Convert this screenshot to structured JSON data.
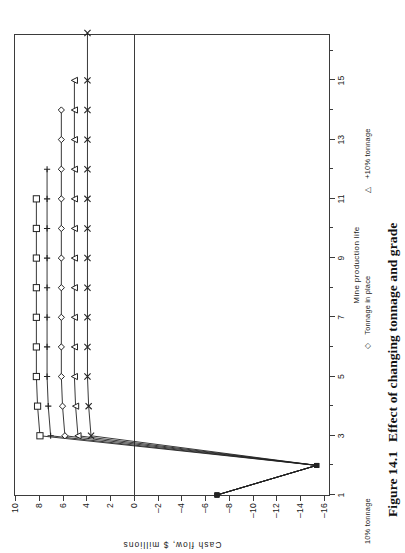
{
  "caption": {
    "number": "Figure 14.1",
    "text": "Effect of changing tonnage and grade"
  },
  "chart_data": {
    "type": "line",
    "title": "",
    "xlabel": "Mine production life",
    "ylabel": "Cash flow, $ millions",
    "xlim": [
      1,
      16.6
    ],
    "ylim": [
      -16.6,
      10
    ],
    "grid": false,
    "legend_position": "below-axis",
    "x_ticks_major": [
      1,
      3,
      5,
      7,
      9,
      11,
      13,
      15
    ],
    "x_ticks_minor": [
      2,
      4,
      6,
      8,
      10,
      12,
      14,
      16
    ],
    "y_ticks_major": [
      10,
      8,
      6,
      4,
      2,
      0,
      -2,
      -4,
      -6,
      -8,
      -10,
      -12,
      -14,
      -16
    ],
    "zero_line": 0,
    "series": [
      {
        "name": "-10% tonnage",
        "marker": "square",
        "x": [
          1,
          2,
          3,
          4,
          5,
          6,
          7,
          8,
          9,
          10,
          11
        ],
        "y": [
          -7.0,
          -15.4,
          7.9,
          8.1,
          8.2,
          8.2,
          8.2,
          8.2,
          8.2,
          8.2,
          8.2
        ]
      },
      {
        "name": "Base case",
        "marker": "plus",
        "x": [
          1,
          2,
          3,
          4,
          5,
          6,
          7,
          8,
          9,
          10,
          11,
          12
        ],
        "y": [
          -7.0,
          -15.4,
          7.0,
          7.2,
          7.3,
          7.3,
          7.3,
          7.3,
          7.3,
          7.3,
          7.3,
          7.3
        ]
      },
      {
        "name": "Tonnage in place",
        "marker": "diamond",
        "x": [
          1,
          2,
          3,
          4,
          5,
          6,
          7,
          8,
          9,
          10,
          11,
          12,
          13,
          14
        ],
        "y": [
          -7.0,
          -15.4,
          5.8,
          6.0,
          6.1,
          6.1,
          6.1,
          6.1,
          6.1,
          6.1,
          6.1,
          6.1,
          6.1,
          6.1
        ]
      },
      {
        "name": "+10% tonnage",
        "marker": "triangle",
        "x": [
          1,
          2,
          3,
          4,
          5,
          6,
          7,
          8,
          9,
          10,
          11,
          12,
          13,
          14,
          15
        ],
        "y": [
          -7.0,
          -15.4,
          4.7,
          4.9,
          5.0,
          5.0,
          5.0,
          5.0,
          5.0,
          5.0,
          5.0,
          5.0,
          5.0,
          5.0,
          5.0
        ]
      },
      {
        "name": "Grade change",
        "marker": "cross",
        "x": [
          1,
          2,
          3,
          4,
          5,
          6,
          7,
          8,
          9,
          10,
          11,
          12,
          13,
          14,
          15,
          16.6
        ],
        "y": [
          -7.0,
          -15.4,
          3.6,
          3.8,
          3.9,
          3.9,
          3.9,
          3.9,
          3.9,
          3.9,
          3.9,
          3.9,
          3.9,
          3.9,
          3.9,
          3.9
        ]
      }
    ],
    "legend": [
      {
        "label": "10% tonnage",
        "marker": ""
      },
      {
        "label": "Tonnage in place",
        "marker": "diamond"
      },
      {
        "label": "+10% tonnage",
        "marker": "triangle"
      }
    ],
    "legend_secondary_label": "Mine production life"
  }
}
